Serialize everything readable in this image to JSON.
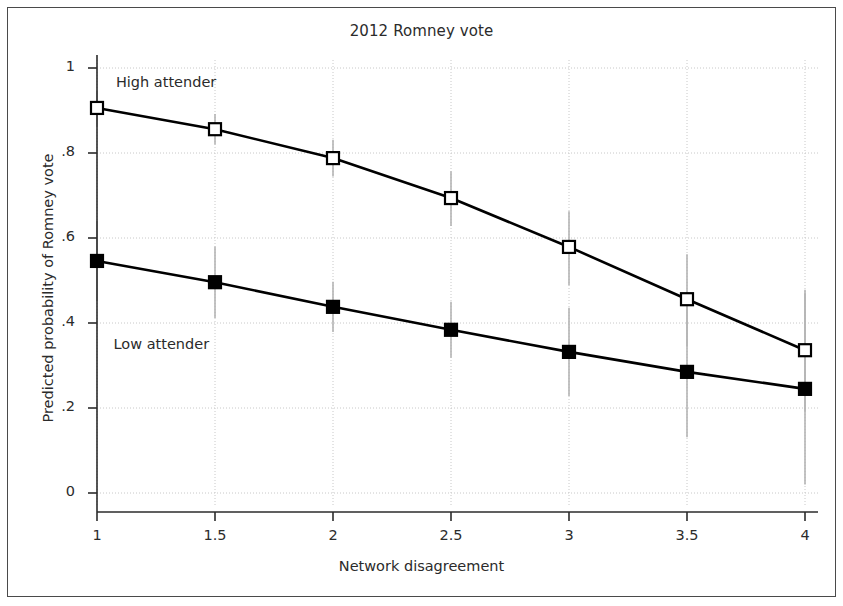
{
  "figure": {
    "width": 843,
    "height": 606,
    "background": "#ffffff",
    "frame_color": "#4a4a4a"
  },
  "chart_data": {
    "type": "line",
    "title": "2012 Romney vote",
    "xlabel": "Network disagreement",
    "ylabel": "Predicted probability of Romney vote",
    "x": [
      1,
      1.5,
      2,
      2.5,
      3,
      3.5,
      4
    ],
    "xtick_labels": [
      "1",
      "1.5",
      "2",
      "2.5",
      "3",
      "3.5",
      "4"
    ],
    "ytick_values": [
      0,
      0.2,
      0.4,
      0.6,
      0.8,
      1
    ],
    "ytick_labels": [
      "0",
      ".2",
      ".4",
      ".6",
      ".8",
      "1"
    ],
    "xlim": [
      1,
      4
    ],
    "ylim": [
      0,
      1
    ],
    "grid": "horizontal-and-vertical-dotted",
    "grid_color": "#c8c8c8",
    "legend": "inline-annotations",
    "series": [
      {
        "name": "High attender",
        "marker": "open-square",
        "marker_fill": "#ffffff",
        "line_color": "#000000",
        "values": [
          0.906,
          0.856,
          0.788,
          0.694,
          0.579,
          0.456,
          0.336
        ],
        "ci_low": [
          0.862,
          0.82,
          0.745,
          0.628,
          0.489,
          0.345,
          0.192
        ],
        "ci_high": [
          0.946,
          0.892,
          0.831,
          0.757,
          0.663,
          0.562,
          0.478
        ]
      },
      {
        "name": "Low attender",
        "marker": "filled-square",
        "marker_fill": "#000000",
        "line_color": "#000000",
        "values": [
          0.546,
          0.496,
          0.438,
          0.384,
          0.332,
          0.285,
          0.245
        ],
        "ci_low": [
          0.452,
          0.412,
          0.379,
          0.318,
          0.228,
          0.131,
          0.02
        ],
        "ci_high": [
          0.64,
          0.58,
          0.497,
          0.45,
          0.436,
          0.439,
          0.47
        ]
      }
    ],
    "annotations": [
      {
        "text": "High attender",
        "x": 1.08,
        "y": 0.963
      },
      {
        "text": "Low attender",
        "x": 1.07,
        "y": 0.345
      }
    ]
  }
}
